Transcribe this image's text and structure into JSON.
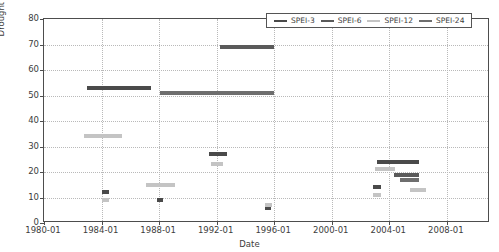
{
  "chart_data": {
    "type": "bar",
    "title": "",
    "xlabel": "Date",
    "ylabel": "Drought severity (months)",
    "ylim": [
      0,
      80
    ],
    "yticks": [
      0,
      10,
      20,
      30,
      40,
      50,
      60,
      70,
      80
    ],
    "xlim": [
      "1980-01",
      "2011-01"
    ],
    "xticks": [
      "1980-01",
      "1984-01",
      "1988-01",
      "1992-01",
      "1996-01",
      "2000-01",
      "2004-01",
      "2008-01"
    ],
    "grid": true,
    "legend_position": "upper right",
    "legend": [
      "SPEI-3",
      "SPEI-6",
      "SPEI-12",
      "SPEI-24"
    ],
    "series": [
      {
        "name": "SPEI-3",
        "color": "#4a4a4a",
        "segments": [
          {
            "start": "1983-01",
            "end": "1987-06",
            "value": 53
          },
          {
            "start": "1984-01",
            "end": "1984-07",
            "value": 12
          },
          {
            "start": "1987-11",
            "end": "1988-04",
            "value": 9
          },
          {
            "start": "1991-07",
            "end": "1992-10",
            "value": 27
          },
          {
            "start": "1995-05",
            "end": "1995-10",
            "value": 6
          },
          {
            "start": "2002-11",
            "end": "2003-06",
            "value": 14
          },
          {
            "start": "2003-03",
            "end": "2006-02",
            "value": 24
          }
        ]
      },
      {
        "name": "SPEI-6",
        "color": "#5a5a5a",
        "segments": [
          {
            "start": "1992-04",
            "end": "1996-01",
            "value": 69
          },
          {
            "start": "2004-05",
            "end": "2006-02",
            "value": 19
          }
        ]
      },
      {
        "name": "SPEI-12",
        "color": "#c4c4c4",
        "segments": [
          {
            "start": "1982-10",
            "end": "1985-06",
            "value": 34
          },
          {
            "start": "1984-01",
            "end": "1984-07",
            "value": 9
          },
          {
            "start": "1987-02",
            "end": "1989-02",
            "value": 15
          },
          {
            "start": "1991-08",
            "end": "1992-06",
            "value": 23
          },
          {
            "start": "1995-05",
            "end": "1995-11",
            "value": 7
          },
          {
            "start": "2002-11",
            "end": "2003-06",
            "value": 11
          },
          {
            "start": "2003-01",
            "end": "2004-06",
            "value": 21
          },
          {
            "start": "2005-06",
            "end": "2006-08",
            "value": 13
          }
        ]
      },
      {
        "name": "SPEI-24",
        "color": "#6e6e6e",
        "segments": [
          {
            "start": "1988-02",
            "end": "1996-01",
            "value": 51
          },
          {
            "start": "2004-10",
            "end": "2006-02",
            "value": 17
          }
        ]
      }
    ]
  }
}
